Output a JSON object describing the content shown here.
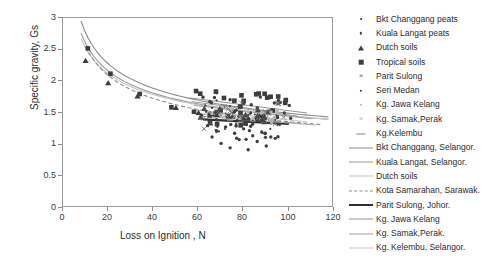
{
  "chart_data": {
    "type": "scatter",
    "title": "",
    "xlabel": "Loss on Ignition , N",
    "ylabel": "Specific gravity, Gs",
    "xlim": [
      0,
      120
    ],
    "ylim": [
      0,
      3
    ],
    "xticks": [
      "0",
      "20",
      "40",
      "60",
      "80",
      "100",
      "120"
    ],
    "yticks": [
      "0",
      "0.5",
      "1",
      "1.5",
      "2",
      "2.5",
      "3"
    ],
    "grid": false,
    "legend_position": "right",
    "marker_series": [
      {
        "name": "Bkt Changgang peats",
        "marker": "small-dot",
        "color": "#3d3d3d",
        "points": [
          [
            63,
            1.62
          ],
          [
            66,
            1.58
          ],
          [
            68,
            1.7
          ],
          [
            70,
            1.55
          ],
          [
            72,
            1.49
          ],
          [
            74,
            1.61
          ],
          [
            76,
            1.44
          ],
          [
            78,
            1.52
          ],
          [
            80,
            1.4
          ],
          [
            82,
            1.47
          ],
          [
            84,
            1.38
          ],
          [
            86,
            1.44
          ],
          [
            88,
            1.35
          ],
          [
            90,
            1.42
          ],
          [
            92,
            1.33
          ],
          [
            94,
            1.39
          ],
          [
            96,
            1.31
          ]
        ]
      },
      {
        "name": "Kuala Langat peats",
        "marker": "dot",
        "color": "#3d3d3d",
        "points": [
          [
            62,
            1.75
          ],
          [
            65,
            1.68
          ],
          [
            68,
            1.82
          ],
          [
            71,
            1.6
          ],
          [
            74,
            1.71
          ],
          [
            77,
            1.55
          ],
          [
            80,
            1.65
          ],
          [
            83,
            1.5
          ],
          [
            86,
            1.58
          ],
          [
            89,
            1.46
          ],
          [
            92,
            1.54
          ],
          [
            95,
            1.43
          ],
          [
            98,
            1.5
          ]
        ]
      },
      {
        "name": "Dutch soils",
        "marker": "triangle",
        "color": "#3d3d3d",
        "points": [
          [
            10,
            2.32
          ],
          [
            20,
            1.97
          ],
          [
            33,
            1.76
          ],
          [
            50,
            1.58
          ],
          [
            60,
            1.5
          ],
          [
            68,
            1.47
          ],
          [
            75,
            1.44
          ],
          [
            82,
            1.41
          ],
          [
            88,
            1.39
          ]
        ]
      },
      {
        "name": "Tropical soils",
        "marker": "square",
        "color": "#3d3d3d",
        "points": [
          [
            11,
            2.52
          ],
          [
            21,
            2.12
          ],
          [
            34,
            1.8
          ],
          [
            48,
            1.59
          ],
          [
            58,
            1.52
          ],
          [
            66,
            1.48
          ],
          [
            73,
            1.45
          ],
          [
            80,
            1.42
          ],
          [
            86,
            1.4
          ]
        ]
      },
      {
        "name": "Parit Sulong",
        "marker": "cross",
        "color": "#6e6e6e",
        "points": [
          [
            66,
            1.5
          ],
          [
            70,
            1.46
          ],
          [
            74,
            1.48
          ],
          [
            78,
            1.43
          ],
          [
            82,
            1.45
          ],
          [
            86,
            1.41
          ],
          [
            90,
            1.43
          ]
        ]
      },
      {
        "name": "Seri Medan",
        "marker": "dot",
        "color": "#3d3d3d",
        "points": [
          [
            64,
            1.3
          ],
          [
            68,
            1.22
          ],
          [
            72,
            1.28
          ],
          [
            76,
            1.18
          ],
          [
            80,
            1.25
          ],
          [
            84,
            1.14
          ],
          [
            88,
            1.2
          ],
          [
            92,
            1.12
          ]
        ]
      },
      {
        "name": "Kg. Jawa Kelang",
        "marker": "dot-light",
        "color": "#b4b4b4",
        "points": [
          [
            70,
            1.58
          ],
          [
            74,
            1.54
          ],
          [
            78,
            1.56
          ],
          [
            82,
            1.52
          ],
          [
            86,
            1.54
          ],
          [
            90,
            1.5
          ]
        ]
      },
      {
        "name": "Kg. Samak,Perak",
        "marker": "cross-light",
        "color": "#b8b8b8",
        "points": [
          [
            72,
            1.47
          ],
          [
            76,
            1.44
          ],
          [
            80,
            1.46
          ],
          [
            84,
            1.42
          ],
          [
            88,
            1.44
          ],
          [
            92,
            1.4
          ]
        ]
      },
      {
        "name": "Kg.Kelembu",
        "marker": "dash",
        "color": "#8a8a8a",
        "points": [
          [
            74,
            1.38
          ],
          [
            79,
            1.36
          ],
          [
            84,
            1.37
          ],
          [
            89,
            1.35
          ],
          [
            94,
            1.36
          ]
        ]
      }
    ],
    "line_series": [
      {
        "name": "Bkt Changgang, Selangor.",
        "style": "solid",
        "color": "#8d8d8d",
        "width": 1.1
      },
      {
        "name": "Kuala Langat, Selangor.",
        "style": "solid",
        "color": "#9b9b9b",
        "width": 1.1
      },
      {
        "name": "Dutch soils",
        "style": "solid",
        "color": "#c3c3c3",
        "width": 1.1
      },
      {
        "name": "Kota Samarahan, Sarawak.",
        "style": "dashed",
        "color": "#8d8d8d",
        "width": 1.1
      },
      {
        "name": "Parit Sulong, Johor.",
        "style": "thick-solid",
        "color": "#303030",
        "width": 2.6
      },
      {
        "name": "Kg. Jawa Kelang",
        "style": "solid",
        "color": "#949494",
        "width": 1.1
      },
      {
        "name": "Kg. Samak,Perak.",
        "style": "solid",
        "color": "#a2a2a2",
        "width": 1.1
      },
      {
        "name": "Kg. Kelembu, Selangor.",
        "style": "solid",
        "color": "#c8c8c8",
        "width": 1.1
      }
    ]
  },
  "axes": {
    "y_title": "Specific gravity, Gs",
    "x_title": "Loss on Ignition , N",
    "y_ticks": [
      "3",
      "2.5",
      "2",
      "1.5",
      "1",
      "0.5",
      "0"
    ],
    "x_ticks": [
      "0",
      "20",
      "40",
      "60",
      "80",
      "100",
      "120"
    ]
  },
  "legend": {
    "markers": [
      {
        "label": "Bkt Changgang peats"
      },
      {
        "label": "Kuala Langat peats"
      },
      {
        "label": "Dutch soils"
      },
      {
        "label": "Tropical soils"
      },
      {
        "label": "Parit Sulong"
      },
      {
        "label": "Seri Medan"
      },
      {
        "label": "Kg. Jawa Kelang"
      },
      {
        "label": "Kg. Samak,Perak"
      },
      {
        "label": "Kg.Kelembu"
      }
    ],
    "lines": [
      {
        "label": "Bkt Changgang, Selangor."
      },
      {
        "label": "Kuala Langat, Selangor."
      },
      {
        "label": "Dutch soils"
      },
      {
        "label": "Kota Samarahan, Sarawak."
      },
      {
        "label": "Parit Sulong, Johor."
      },
      {
        "label": "Kg. Jawa Kelang"
      },
      {
        "label": "Kg. Samak,Perak."
      },
      {
        "label": "Kg. Kelembu, Selangor."
      }
    ]
  }
}
